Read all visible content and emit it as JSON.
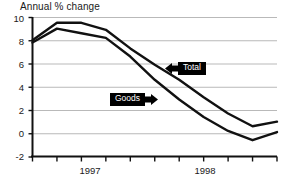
{
  "chart_data": {
    "type": "line",
    "title": "Annual % change",
    "xlabel": "",
    "ylabel": "Annual % change",
    "ylim": [
      -2,
      10
    ],
    "yticks": [
      10,
      8,
      6,
      4,
      2,
      0,
      -2
    ],
    "ytick_labels": [
      "10",
      "8",
      "6",
      "4",
      "2",
      "0",
      "-2"
    ],
    "xlim": [
      0,
      10
    ],
    "xtick_labels": [
      "1997",
      "1998"
    ],
    "xtick_count": 11,
    "grid": true,
    "grid_axis": "y",
    "legend_position": "inline-annotations",
    "x": [
      0,
      1,
      2,
      3,
      4,
      5,
      6,
      7,
      8,
      9,
      10
    ],
    "series": [
      {
        "name": "Total",
        "color": "#111111",
        "values": [
          8.0,
          9.5,
          9.5,
          8.9,
          7.3,
          5.9,
          4.6,
          3.1,
          1.7,
          0.6,
          1.0
        ]
      },
      {
        "name": "Goods",
        "color": "#111111",
        "values": [
          7.8,
          9.0,
          8.6,
          8.2,
          6.6,
          4.6,
          2.9,
          1.4,
          0.2,
          -0.6,
          0.1
        ]
      }
    ],
    "annotations": [
      {
        "label": "Total",
        "box_x": 178,
        "box_y": 62,
        "arrow_dir": "left"
      },
      {
        "label": "Goods",
        "box_x": 110,
        "box_y": 93,
        "arrow_dir": "right"
      }
    ],
    "colors": {
      "axis": "#111111",
      "grid": "#b9b9b9",
      "line": "#111111",
      "annotation_bg": "#000000",
      "annotation_text": "#ffffff",
      "background": "#ffffff"
    }
  }
}
